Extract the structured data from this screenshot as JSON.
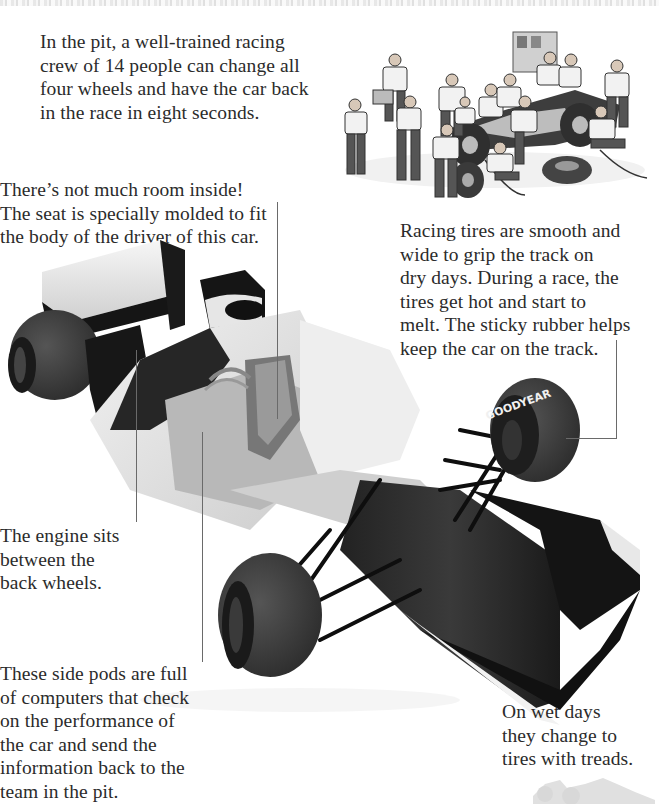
{
  "page": {
    "type": "illustrated-book-spread",
    "background": "#ffffff",
    "text_color": "#2b2b2b"
  },
  "captions": {
    "pit_crew": "In the pit, a well-trained racing\ncrew of 14 people can change all\nfour wheels and have the car back\nin the race in eight seconds.",
    "seat": "There’s not much room inside!\nThe seat is specially molded to fit\nthe body of the driver of this car.",
    "tires": "Racing tires are smooth and\nwide to grip the track on\ndry days. During a race, the\ntires get hot and start to\nmelt. The sticky rubber helps\nkeep the car on the track.",
    "engine": "The engine sits\nbetween the\nback wheels.",
    "side_pods": "These side pods are full\nof computers that check\non the performance of\nthe car and send the\ninformation back to the\nteam in the pit.",
    "wet_tires": "On wet days\nthey change to\ntires with treads."
  },
  "illustrations": {
    "pit_stop": {
      "label": "pit-crew-illustration",
      "crew_count": 14
    },
    "race_car": {
      "label": "formula-one-car-cutaway",
      "tire_brand": "GOODYEAR"
    },
    "silhouette": {
      "label": "car-silhouette-watermark"
    }
  },
  "colors": {
    "tire": "#3a3a3a",
    "body_light": "#e8e8e8",
    "body_dark": "#151515",
    "leader_line": "#6a6a6a"
  }
}
